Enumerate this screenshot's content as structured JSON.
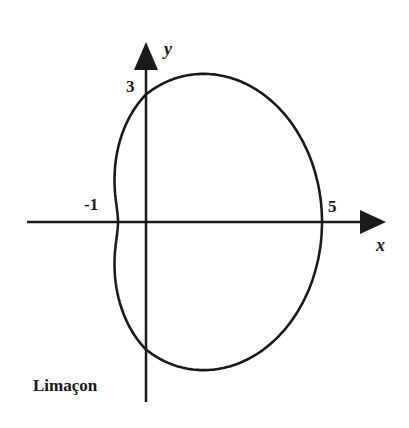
{
  "figure": {
    "caption": "Limaçon",
    "equation_hint": "r = 3 + 2cos(θ)",
    "axes": {
      "x_label": "x",
      "y_label": "y"
    },
    "tick_labels": {
      "y_intercept": "3",
      "x_left": "-1",
      "x_right": "5"
    },
    "colors": {
      "ink": "#1a1a1a",
      "background": "#ffffff"
    }
  }
}
